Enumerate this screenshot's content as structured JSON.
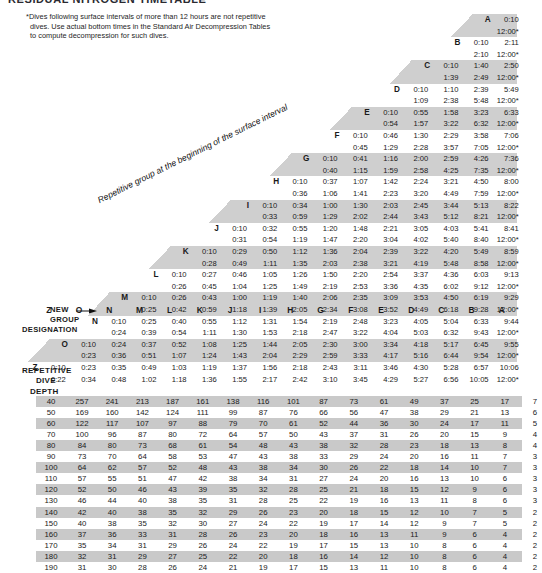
{
  "title": "RESIDUAL NITROGEN TIMETABLE",
  "footnote": {
    "marker": "*",
    "text": "Dives following surface intervals of more than 12 hours are not repetitive dives. Use actual bottom times in the Standard Air Decompression Tables to compute decompression for such dives."
  },
  "surface_interval": {
    "caption": "Repetitive group at the beginning of the surface interval",
    "new_group_label_line1": "NEW",
    "new_group_label_line2": "GROUP",
    "new_group_label_line3": "DESIGNATION",
    "arrow_icon": "right-arrow-icon",
    "column_letters": [
      "Z",
      "O",
      "N",
      "M",
      "L",
      "K",
      "J",
      "I",
      "H",
      "G",
      "F",
      "E",
      "D",
      "C",
      "B",
      "A"
    ],
    "rows": [
      {
        "group": "A",
        "min": [
          "0:10"
        ],
        "max": [
          "12:00*"
        ]
      },
      {
        "group": "B",
        "min": [
          "0:10",
          "2:11"
        ],
        "max": [
          "2:10",
          "12:00*"
        ]
      },
      {
        "group": "C",
        "min": [
          "0:10",
          "1:40",
          "2:50"
        ],
        "max": [
          "1:39",
          "2:49",
          "12:00*"
        ]
      },
      {
        "group": "D",
        "min": [
          "0:10",
          "1:10",
          "2:39",
          "5:49"
        ],
        "max": [
          "1:09",
          "2:38",
          "5:48",
          "12:00*"
        ]
      },
      {
        "group": "E",
        "min": [
          "0:10",
          "0:55",
          "1:58",
          "3:23",
          "6:33"
        ],
        "max": [
          "0:54",
          "1:57",
          "3:22",
          "6:32",
          "12:00*"
        ]
      },
      {
        "group": "F",
        "min": [
          "0:10",
          "0:46",
          "1:30",
          "2:29",
          "3:58",
          "7:06"
        ],
        "max": [
          "0:45",
          "1:29",
          "2:28",
          "3:57",
          "7:05",
          "12:00*"
        ]
      },
      {
        "group": "G",
        "min": [
          "0:10",
          "0:41",
          "1:16",
          "2:00",
          "2:59",
          "4:26",
          "7:36"
        ],
        "max": [
          "0:40",
          "1:15",
          "1:59",
          "2:58",
          "4:25",
          "7:35",
          "12:00*"
        ]
      },
      {
        "group": "H",
        "min": [
          "0:10",
          "0:37",
          "1:07",
          "1:42",
          "2:24",
          "3:21",
          "4:50",
          "8:00"
        ],
        "max": [
          "0:36",
          "1:06",
          "1:41",
          "2:23",
          "3:20",
          "4:49",
          "7:59",
          "12:00*"
        ]
      },
      {
        "group": "I",
        "min": [
          "0:10",
          "0:34",
          "1:00",
          "1:30",
          "2:03",
          "2:45",
          "3:44",
          "5:13",
          "8:22"
        ],
        "max": [
          "0:33",
          "0:59",
          "1:29",
          "2:02",
          "2:44",
          "3:43",
          "5:12",
          "8:21",
          "12:00*"
        ]
      },
      {
        "group": "J",
        "min": [
          "0:10",
          "0:32",
          "0:55",
          "1:20",
          "1:48",
          "2:21",
          "3:05",
          "4:03",
          "5:41",
          "8:41"
        ],
        "max": [
          "0:31",
          "0:54",
          "1:19",
          "1:47",
          "2:20",
          "3:04",
          "4:02",
          "5:40",
          "8:40",
          "12:00*"
        ]
      },
      {
        "group": "K",
        "min": [
          "0:10",
          "0:29",
          "0:50",
          "1:12",
          "1:36",
          "2:04",
          "2:39",
          "3:22",
          "4:20",
          "5:49",
          "8:59"
        ],
        "max": [
          "0:28",
          "0:49",
          "1:11",
          "1:35",
          "2:03",
          "2:38",
          "3:21",
          "4:19",
          "5:48",
          "8:58",
          "12:00*"
        ]
      },
      {
        "group": "L",
        "min": [
          "0:10",
          "0:27",
          "0:46",
          "1:05",
          "1:26",
          "1:50",
          "2:20",
          "2:54",
          "3:37",
          "4:36",
          "6:03",
          "9:13"
        ],
        "max": [
          "0:26",
          "0:45",
          "1:04",
          "1:25",
          "1:49",
          "2:19",
          "2:53",
          "3:36",
          "4:35",
          "6:02",
          "9:12",
          "12:00*"
        ]
      },
      {
        "group": "M",
        "min": [
          "0:10",
          "0:26",
          "0:43",
          "1:00",
          "1:19",
          "1:40",
          "2:06",
          "2:35",
          "3:09",
          "3:53",
          "4:50",
          "6:19",
          "9:29"
        ],
        "max": [
          "0:25",
          "0:42",
          "0:59",
          "1:18",
          "1:39",
          "2:05",
          "2:34",
          "3:08",
          "3:52",
          "4:49",
          "6:18",
          "9:28",
          "12:00*"
        ]
      },
      {
        "group": "N",
        "min": [
          "0:10",
          "0:25",
          "0:40",
          "0:55",
          "1:12",
          "1:31",
          "1:54",
          "2:19",
          "2:48",
          "3:23",
          "4:05",
          "5:04",
          "6:33",
          "9:44"
        ],
        "max": [
          "0:24",
          "0:39",
          "0:54",
          "1:11",
          "1:30",
          "1:53",
          "2:18",
          "2:47",
          "3:22",
          "4:04",
          "5:03",
          "6:32",
          "9:43",
          "12:00*"
        ]
      },
      {
        "group": "O",
        "min": [
          "0:10",
          "0:24",
          "0:37",
          "0:52",
          "1:08",
          "1:25",
          "1:44",
          "2:05",
          "2:30",
          "3:00",
          "3:34",
          "4:18",
          "5:17",
          "6:45",
          "9:55"
        ],
        "max": [
          "0:23",
          "0:36",
          "0:51",
          "1:07",
          "1:24",
          "1:43",
          "2:04",
          "2:29",
          "2:59",
          "3:33",
          "4:17",
          "5:16",
          "6:44",
          "9:54",
          "12:00*"
        ]
      },
      {
        "group": "Z",
        "min": [
          "0:10",
          "0:23",
          "0:35",
          "0:49",
          "1:03",
          "1:19",
          "1:37",
          "1:56",
          "2:18",
          "2:43",
          "3:11",
          "3:46",
          "4:30",
          "5:28",
          "6:57",
          "10:06"
        ],
        "max": [
          "0:22",
          "0:34",
          "0:48",
          "1:02",
          "1:18",
          "1:36",
          "1:55",
          "2:17",
          "2:42",
          "3:10",
          "3:45",
          "4:29",
          "5:27",
          "6:56",
          "10:05",
          "12:00*"
        ]
      }
    ]
  },
  "residual_nitrogen": {
    "heading_line1": "REPETITIVE",
    "heading_line2": "DIVE",
    "heading_line3": "DEPTH",
    "depths": [
      40,
      50,
      60,
      70,
      80,
      90,
      100,
      110,
      120,
      130,
      140,
      150,
      160,
      170,
      180,
      190
    ],
    "rows": [
      [
        257,
        241,
        213,
        187,
        161,
        138,
        116,
        101,
        87,
        73,
        61,
        49,
        37,
        25,
        17,
        7
      ],
      [
        169,
        160,
        142,
        124,
        111,
        99,
        87,
        76,
        66,
        56,
        47,
        38,
        29,
        21,
        13,
        6
      ],
      [
        122,
        117,
        107,
        97,
        88,
        79,
        70,
        61,
        52,
        44,
        36,
        30,
        24,
        17,
        11,
        5
      ],
      [
        100,
        96,
        87,
        80,
        72,
        64,
        57,
        50,
        43,
        37,
        31,
        26,
        20,
        15,
        9,
        4
      ],
      [
        84,
        80,
        73,
        68,
        61,
        54,
        48,
        43,
        38,
        32,
        28,
        23,
        18,
        13,
        8,
        4
      ],
      [
        73,
        70,
        64,
        58,
        53,
        47,
        43,
        38,
        33,
        29,
        24,
        20,
        16,
        11,
        7,
        3
      ],
      [
        64,
        62,
        57,
        52,
        48,
        43,
        38,
        34,
        30,
        26,
        22,
        18,
        14,
        10,
        7,
        3
      ],
      [
        57,
        55,
        51,
        47,
        42,
        38,
        34,
        31,
        27,
        24,
        20,
        16,
        13,
        10,
        6,
        3
      ],
      [
        52,
        50,
        46,
        43,
        39,
        35,
        32,
        28,
        25,
        21,
        18,
        15,
        12,
        9,
        6,
        3
      ],
      [
        46,
        44,
        40,
        38,
        35,
        31,
        28,
        25,
        22,
        19,
        16,
        13,
        11,
        8,
        6,
        3
      ],
      [
        42,
        40,
        38,
        35,
        32,
        29,
        26,
        23,
        20,
        18,
        15,
        12,
        10,
        7,
        5,
        2
      ],
      [
        40,
        38,
        35,
        32,
        30,
        27,
        24,
        22,
        19,
        17,
        14,
        12,
        9,
        7,
        5,
        2
      ],
      [
        37,
        36,
        33,
        31,
        28,
        26,
        23,
        20,
        18,
        16,
        13,
        11,
        9,
        6,
        4,
        2
      ],
      [
        35,
        34,
        31,
        29,
        26,
        24,
        22,
        19,
        17,
        15,
        13,
        10,
        8,
        6,
        4,
        2
      ],
      [
        32,
        31,
        29,
        27,
        25,
        22,
        20,
        18,
        16,
        14,
        12,
        10,
        8,
        6,
        4,
        2
      ],
      [
        31,
        30,
        28,
        26,
        24,
        21,
        19,
        17,
        15,
        13,
        11,
        10,
        8,
        6,
        4,
        2
      ]
    ]
  }
}
